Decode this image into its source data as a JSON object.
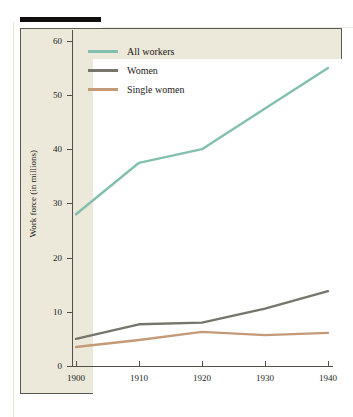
{
  "figure": {
    "background_color": "#ece8da",
    "plot_background_color": "#ffffff",
    "frame_color": "#5d5a53",
    "top_rule_color": "#100f0d"
  },
  "axes": {
    "y_label": "Work force (in millions)",
    "y_ticks": [
      "0",
      "10",
      "20",
      "30",
      "40",
      "50",
      "60"
    ],
    "x_ticks": [
      "1900",
      "1910",
      "1920",
      "1930",
      "1940"
    ]
  },
  "legend": {
    "position": "top-left-inside",
    "entries": [
      {
        "label": "All workers",
        "color": "#83bfb0"
      },
      {
        "label": "Women",
        "color": "#77746c"
      },
      {
        "label": "Single women",
        "color": "#c49a78"
      }
    ]
  },
  "chart_data": {
    "type": "line",
    "title": "",
    "xlabel": "",
    "ylabel": "Work force (in millions)",
    "x": [
      1900,
      1910,
      1920,
      1930,
      1940
    ],
    "xlim": [
      1900,
      1940
    ],
    "ylim": [
      0,
      62
    ],
    "grid": false,
    "series": [
      {
        "name": "All workers",
        "color": "#83bfb0",
        "values": [
          28.0,
          37.5,
          40.0,
          47.5,
          55.0
        ]
      },
      {
        "name": "Women",
        "color": "#77746c",
        "values": [
          5.0,
          7.7,
          8.0,
          10.6,
          13.8
        ]
      },
      {
        "name": "Single women",
        "color": "#c49a78",
        "values": [
          3.5,
          4.8,
          6.3,
          5.7,
          6.1
        ]
      }
    ]
  }
}
